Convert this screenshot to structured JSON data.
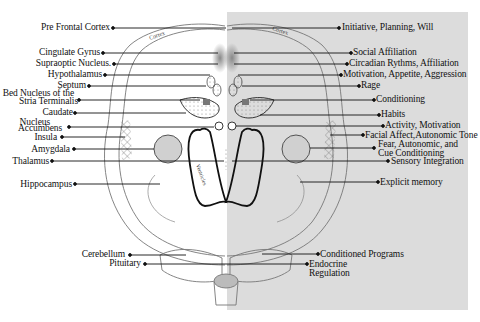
{
  "diagram": {
    "panel_color": "#dcdcdc",
    "structure_labels": [
      {
        "id": "pre-frontal-cortex",
        "label": "Pre Frontal Cortex"
      },
      {
        "id": "cingulate-gyrus",
        "label": "Cingulate Gyrus"
      },
      {
        "id": "supraoptic-nucleus",
        "label": "Supraoptic Nucleus."
      },
      {
        "id": "hypothalamus",
        "label": "Hypothalamus"
      },
      {
        "id": "septum",
        "label": "Septum"
      },
      {
        "id": "bed-nucleus",
        "label_line1": "Bed Nucleus of the",
        "label_line2": "Stria Terminalis"
      },
      {
        "id": "caudate",
        "label": "Caudate"
      },
      {
        "id": "nucleus-accumbens",
        "label_line1": "Nucleus",
        "label_line2": "Accumbens"
      },
      {
        "id": "insula",
        "label": "Insula"
      },
      {
        "id": "amygdala",
        "label": "Amygdala"
      },
      {
        "id": "thalamus",
        "label": "Thalamus"
      },
      {
        "id": "hippocampus",
        "label": "Hippocampus"
      },
      {
        "id": "cerebellum",
        "label": "Cerebellum"
      },
      {
        "id": "pituitary",
        "label": "Pituitary"
      }
    ],
    "function_labels": [
      {
        "id": "initiative",
        "label": "Initiative, Planning, Will"
      },
      {
        "id": "social-affiliation",
        "label": "Social Affiliation"
      },
      {
        "id": "circadian",
        "label": "Circadian Rythms, Affiliation"
      },
      {
        "id": "motivation-appetite",
        "label": "Motivation, Appetite, Aggression"
      },
      {
        "id": "rage",
        "label": "Rage"
      },
      {
        "id": "conditioning",
        "label": "Conditioning"
      },
      {
        "id": "habits",
        "label": "Habits"
      },
      {
        "id": "activity-motivation",
        "label": "Activity, Motivation"
      },
      {
        "id": "facial-affect",
        "label": "Facial Affect,Autonomic Tone"
      },
      {
        "id": "fear",
        "label_line1": "Fear, Autonomic, and",
        "label_line2": "Cue Conditioning"
      },
      {
        "id": "sensory",
        "label": "Sensory Integration"
      },
      {
        "id": "explicit-memory",
        "label": "Explicit memory"
      },
      {
        "id": "conditioned-programs",
        "label": "Conditioned Programs"
      },
      {
        "id": "endocrine",
        "label_line1": "Endocrine",
        "label_line2": "Regulation"
      }
    ],
    "inner_labels": {
      "cortex_left": "Cortex",
      "cortex_right": "Cortex",
      "ventricles": "Ventricles"
    }
  }
}
